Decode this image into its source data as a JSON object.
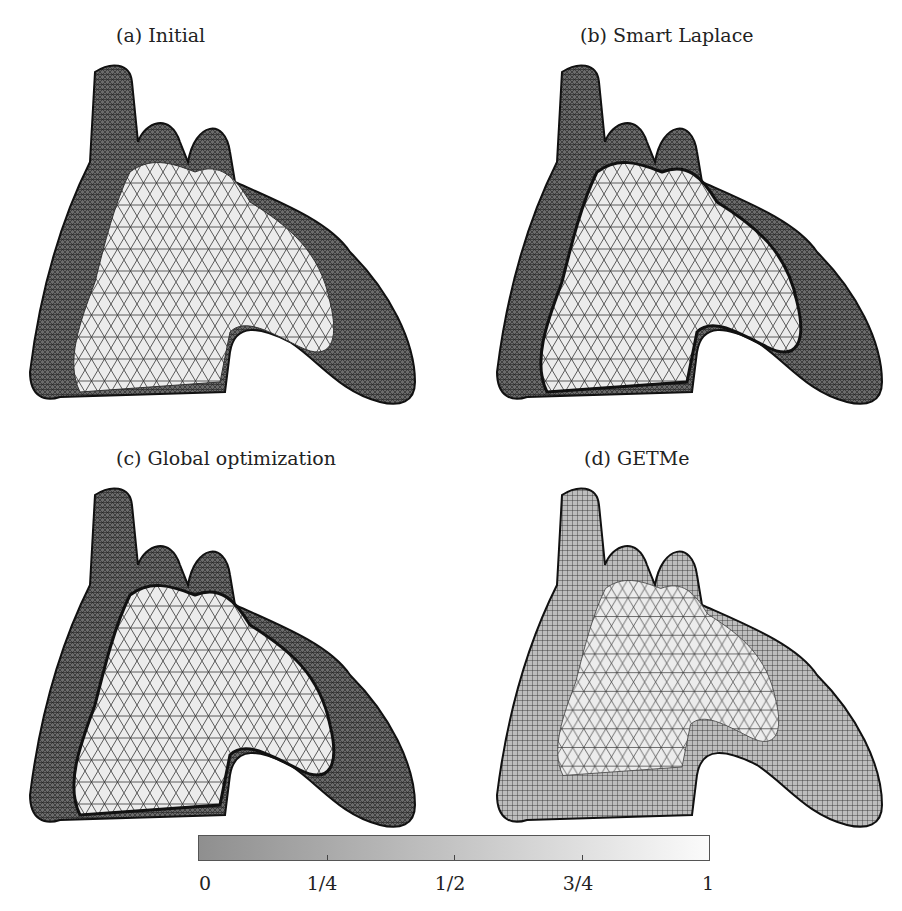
{
  "figure": {
    "panels": [
      {
        "id": "a",
        "title": "(a) Initial",
        "method": "Initial"
      },
      {
        "id": "b",
        "title": "(b) Smart Laplace",
        "method": "Smart Laplace"
      },
      {
        "id": "c",
        "title": "(c) Global optimization",
        "method": "Global optimization"
      },
      {
        "id": "d",
        "title": "(d) GETMe",
        "method": "GETMe"
      }
    ],
    "colorbar": {
      "min": 0,
      "max": 1,
      "tick_labels": [
        "0",
        "1/4",
        "1/2",
        "3/4",
        "1"
      ],
      "color_low": "#8f8f8f",
      "color_high": "#fbfbfb"
    }
  }
}
